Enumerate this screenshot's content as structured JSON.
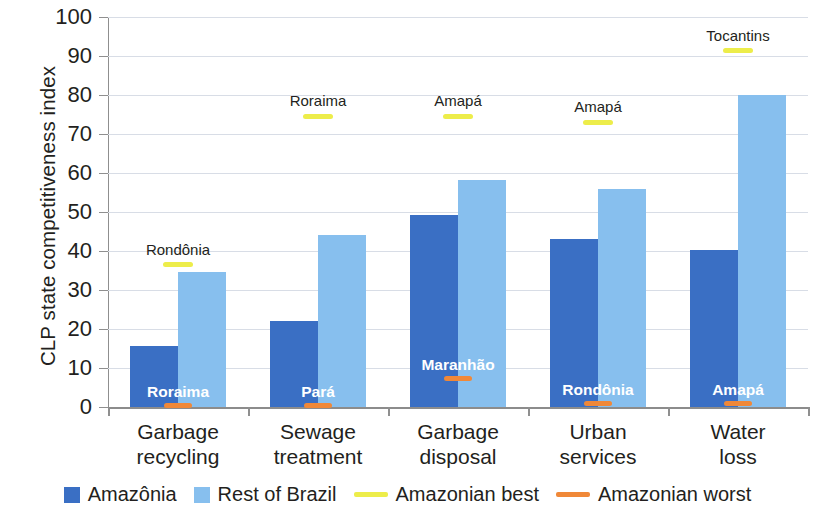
{
  "chart_data": {
    "type": "bar",
    "title": "",
    "xlabel": "",
    "ylabel": "CLP state competitiveness index",
    "ylim": [
      0,
      100
    ],
    "ytick_step": 10,
    "yticks": [
      0,
      10,
      20,
      30,
      40,
      50,
      60,
      70,
      80,
      90,
      100
    ],
    "grid": true,
    "legend_position": "bottom",
    "categories": [
      "Garbage recycling",
      "Sewage treatment",
      "Garbage disposal",
      "Urban services",
      "Water loss"
    ],
    "category_lines": [
      [
        "Garbage",
        "recycling"
      ],
      [
        "Sewage",
        "treatment"
      ],
      [
        "Garbage",
        "disposal"
      ],
      [
        "Urban",
        "services"
      ],
      [
        "Water",
        "loss"
      ]
    ],
    "series": [
      {
        "name": "Amazônia",
        "color": "#3a6fc4",
        "values": [
          15.7,
          22.0,
          49.2,
          43.0,
          40.3
        ]
      },
      {
        "name": "Rest of Brazil",
        "color": "#87bfee",
        "values": [
          34.5,
          44.0,
          58.3,
          56.0,
          80.0
        ]
      }
    ],
    "markers": [
      {
        "name": "Amazonian best",
        "color": "#eded4a",
        "values": [
          36.5,
          74.5,
          74.5,
          73.0,
          91.3
        ],
        "labels": [
          "Rondônia",
          "Roraima",
          "Amapá",
          "Amapá",
          "Tocantins"
        ]
      },
      {
        "name": "Amazonian worst",
        "color": "#f08838",
        "values": [
          0.4,
          0.4,
          7.3,
          0.8,
          0.9
        ],
        "labels": [
          "Roraima",
          "Pará",
          "Maranhão",
          "Rondônia",
          "Amapá"
        ]
      }
    ]
  },
  "legend": {
    "items": [
      {
        "label": "Amazônia",
        "type": "box",
        "color": "#3a6fc4"
      },
      {
        "label": "Rest of Brazil",
        "type": "box",
        "color": "#87bfee"
      },
      {
        "label": "Amazonian best",
        "type": "line",
        "color": "#eded4a"
      },
      {
        "label": "Amazonian worst",
        "type": "line",
        "color": "#f08838"
      }
    ]
  }
}
